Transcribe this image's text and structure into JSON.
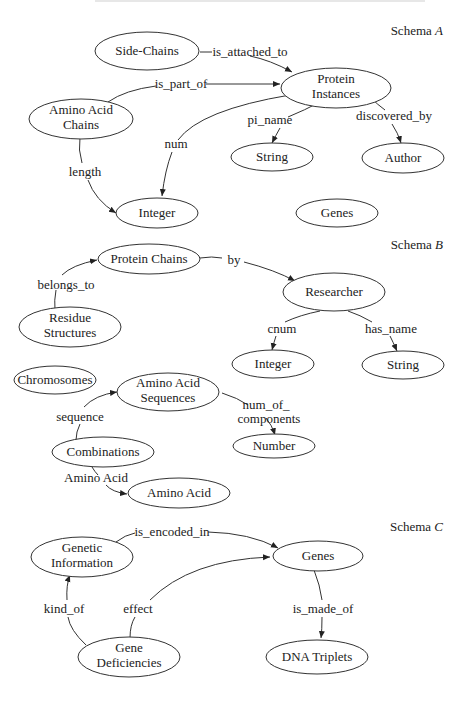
{
  "header_fragment": "",
  "schemas": [
    {
      "label": "Schema ",
      "letter": "A"
    },
    {
      "label": "Schema ",
      "letter": "B"
    },
    {
      "label": "Schema ",
      "letter": "C"
    }
  ],
  "schemaA": {
    "nodes": {
      "side_chains": "Side-Chains",
      "protein_instances_1": "Protein",
      "protein_instances_2": "Instances",
      "amino_acid_chains_1": "Amino Acid",
      "amino_acid_chains_2": "Chains",
      "string": "String",
      "author": "Author",
      "integer": "Integer",
      "genes": "Genes"
    },
    "edges": {
      "is_attached_to": "is_attached_to",
      "is_part_of": "is_part_of",
      "pi_name": "pi_name",
      "discovered_by": "discovered_by",
      "num": "num",
      "length": "length"
    }
  },
  "schemaB": {
    "nodes": {
      "protein_chains": "Protein Chains",
      "researcher": "Researcher",
      "residue_structures_1": "Residue",
      "residue_structures_2": "Structures",
      "integer": "Integer",
      "string": "String",
      "chromosomes": "Chromosomes",
      "amino_acid_sequences_1": "Amino Acid",
      "amino_acid_sequences_2": "Sequences",
      "number": "Number",
      "combinations": "Combinations",
      "amino_acid": "Amino Acid"
    },
    "edges": {
      "by": "by",
      "belongs_to": "belongs_to",
      "cnum": "cnum",
      "has_name": "has_name",
      "num_of_components_1": "num_of_",
      "num_of_components_2": "components",
      "sequence": "sequence",
      "amino_acid": "Amino Acid"
    }
  },
  "schemaC": {
    "nodes": {
      "genetic_information_1": "Genetic",
      "genetic_information_2": "Information",
      "genes": "Genes",
      "gene_deficiencies_1": "Gene",
      "gene_deficiencies_2": "Deficiencies",
      "dna_triplets": "DNA Triplets"
    },
    "edges": {
      "is_encoded_in": "is_encoded_in",
      "kind_of": "kind_of",
      "effect": "effect",
      "is_made_of": "is_made_of"
    }
  }
}
